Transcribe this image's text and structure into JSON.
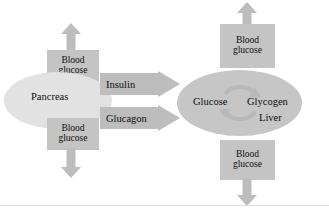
{
  "diagram": {
    "canvas": {
      "width": 329,
      "height": 219,
      "background": "#ffffff"
    },
    "colors": {
      "pancreas_fill": "#e2e2e2",
      "liver_fill": "#c6c6c6",
      "box_fill": "#c4c4c4",
      "arrow_fill": "#bdbdbd",
      "text": "#0d0d0d",
      "rule": "#dcdcdc"
    },
    "organs": {
      "pancreas": {
        "label": "Pancreas"
      },
      "liver": {
        "label": "Liver",
        "substrate_left": "Glucose",
        "substrate_right": "Glycogen",
        "cycle_icon": "cyclic-arrow-icon"
      }
    },
    "boxes": {
      "pancreas_top": {
        "line1": "Blood",
        "line2": "glucose"
      },
      "pancreas_bottom": {
        "line1": "Blood",
        "line2": "glucose"
      },
      "liver_top": {
        "line1": "Blood",
        "line2": "glucose"
      },
      "liver_bottom": {
        "line1": "Blood",
        "line2": "glucose"
      }
    },
    "hormones": {
      "insulin": {
        "label": "Insulin",
        "direction": "right"
      },
      "glucagon": {
        "label": "Glucagon",
        "direction": "right"
      }
    },
    "arrows": {
      "pancreas_up": {
        "name": "up-arrow-icon",
        "direction": "up"
      },
      "pancreas_down": {
        "name": "down-arrow-icon",
        "direction": "down"
      },
      "liver_up": {
        "name": "up-arrow-icon",
        "direction": "up"
      },
      "liver_down": {
        "name": "down-arrow-icon",
        "direction": "down"
      }
    }
  }
}
